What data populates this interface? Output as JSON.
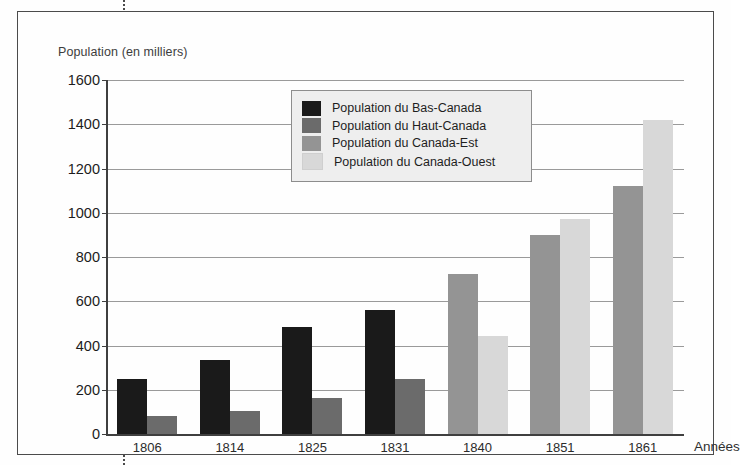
{
  "figure": {
    "y_axis_title": "Population (en milliers)",
    "x_axis_title": "Années"
  },
  "legend": {
    "items": [
      {
        "label": "Population du Bas-Canada",
        "color": "#1a1a1a"
      },
      {
        "label": "Population du Haut-Canada",
        "color": "#6b6b6b"
      },
      {
        "label": "Population du Canada-Est",
        "color": "#949494"
      },
      {
        "label": "Population du Canada-Ouest",
        "color": "#d8d8d8"
      }
    ]
  },
  "chart_data": {
    "type": "bar",
    "title": "",
    "xlabel": "Années",
    "ylabel": "Population (en milliers)",
    "ylim": [
      0,
      1600
    ],
    "ytick_step": 200,
    "yticks": [
      1600,
      1400,
      1200,
      1000,
      800,
      600,
      400,
      200,
      0
    ],
    "grid": true,
    "legend_position": "top-center",
    "categories": [
      "1806",
      "1814",
      "1825",
      "1831",
      "1840",
      "1851",
      "1861"
    ],
    "series": [
      {
        "name": "Population du Bas-Canada",
        "color": "#1a1a1a",
        "values": [
          250,
          335,
          485,
          560,
          null,
          null,
          null
        ]
      },
      {
        "name": "Population du Haut-Canada",
        "color": "#6b6b6b",
        "values": [
          80,
          105,
          165,
          250,
          null,
          null,
          null
        ]
      },
      {
        "name": "Population du Canada-Est",
        "color": "#949494",
        "values": [
          null,
          null,
          null,
          null,
          725,
          900,
          1120
        ]
      },
      {
        "name": "Population du Canada-Ouest",
        "color": "#d8d8d8",
        "values": [
          null,
          null,
          null,
          null,
          445,
          970,
          1420
        ]
      }
    ]
  }
}
